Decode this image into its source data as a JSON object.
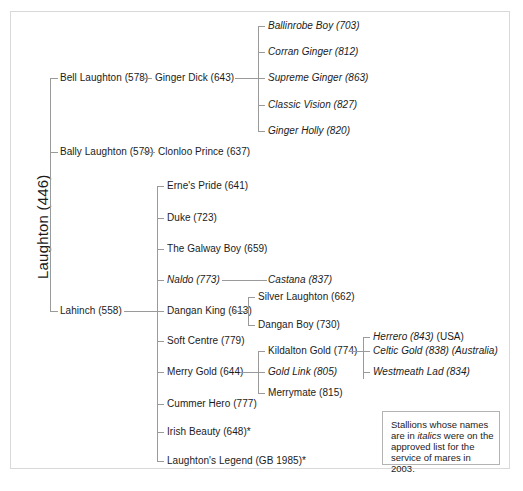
{
  "diagram": {
    "root": {
      "label": "Laughton (446)"
    },
    "legend": {
      "text_before": "Stallions whose names are in ",
      "emphasis": "italics",
      "text_after": " were on the approved list for the service of mares in 2003."
    },
    "nodes": {
      "bell_laughton": "Bell Laughton (578)",
      "ginger_dick": "Ginger Dick (643)",
      "ballinrobe_boy": "Ballinrobe Boy (703)",
      "corran_ginger": "Corran Ginger (812)",
      "supreme_ginger": "Supreme Ginger (863)",
      "classic_vision": "Classic Vision  (827)",
      "ginger_holly": "Ginger Holly (820)",
      "bally_laughton": "Bally Laughton (579)",
      "clonloo_prince": "Clonloo Prince (637)",
      "lahinch": "Lahinch (558)",
      "ernes_pride": "Erne's Pride (641)",
      "duke": "Duke (723)",
      "the_galway_boy": "The Galway Boy (659)",
      "naldo": "Naldo (773)",
      "castana": "Castana (837)",
      "dangan_king": "Dangan King (613)",
      "silver_laughton": "Silver Laughton (662)",
      "dangan_boy": "Dangan Boy (730)",
      "soft_centre": "Soft Centre (779)",
      "merry_gold": "Merry Gold (644)",
      "kildalton_gold": "Kildalton Gold (774)",
      "gold_link": "Gold Link (805)",
      "merrymate": "Merrymate (815)",
      "herrero_name": "Herrero (843) ",
      "herrero_country": "(USA)",
      "celtic_gold_name": "Celtic Gold (838) ",
      "celtic_gold_country": "(Australia)",
      "westmeath_lad": "Westmeath Lad (834)",
      "cummer_hero": "Cummer Hero (777)",
      "irish_beauty": "Irish Beauty (648)*",
      "laughtons_legend": "Laughton's Legend (GB 1985)*"
    },
    "colors": {
      "text": "#1b1b1b",
      "line": "#9a9a9a",
      "frame": "#d9d9d9",
      "legend_border": "#b3b3b3",
      "background": "#ffffff"
    }
  }
}
